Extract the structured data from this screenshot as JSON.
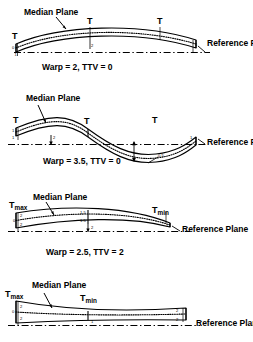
{
  "figure": {
    "stroke_color": "#000000",
    "background_color": "#ffffff"
  },
  "labels": {
    "median_plane": "Median Plane",
    "reference_plane": "Reference Plane",
    "t": "T",
    "t_max_base": "T",
    "t_max_sub": "max",
    "t_min_base": "T",
    "t_min_sub": "min"
  },
  "panels": [
    {
      "id": "panel-1",
      "caption": "Warp = 2,   TTV = 0",
      "warp": "2",
      "ttv": "0",
      "shape": "convex-bow",
      "thickness_labels": [
        "T",
        "T",
        "T"
      ],
      "dimension_values": [
        "0",
        "1",
        "2",
        "1"
      ]
    },
    {
      "id": "panel-2",
      "caption": "Warp = 3.5,  TTV = 0",
      "warp": "3.5",
      "ttv": "0",
      "shape": "s-curve",
      "thickness_labels": [
        "T",
        "T",
        "T"
      ],
      "dimension_values": [
        "1",
        "1",
        "2",
        "1",
        "0.5"
      ]
    },
    {
      "id": "panel-3",
      "caption": "Warp = 2.5,  TTV = 2",
      "warp": "2.5",
      "ttv": "2",
      "shape": "tapered-bow",
      "thickness_labels": [
        "Tmax",
        "Tmin"
      ],
      "dimension_values": [
        "2",
        "0",
        "2",
        "1.5",
        "1.5",
        "2",
        "1"
      ]
    },
    {
      "id": "panel-4",
      "caption": "",
      "warp": "",
      "ttv": "",
      "shape": "hourglass-taper",
      "thickness_labels": [
        "Tmax",
        "Tmin"
      ],
      "dimension_values": [
        "2",
        "0",
        "2",
        "1",
        "2",
        "2"
      ]
    }
  ]
}
